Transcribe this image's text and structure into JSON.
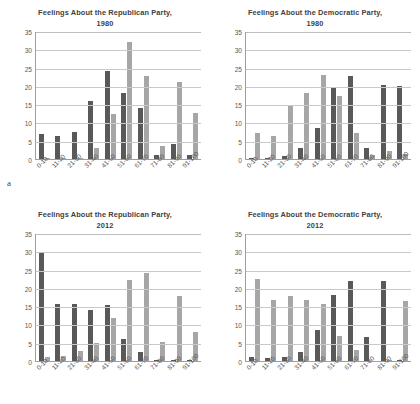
{
  "figure": {
    "panel_a_label": "a",
    "panel_b_label": "b",
    "series_colors": {
      "series1": "#595959",
      "series2": "#a6a6a6"
    }
  },
  "chart_data": [
    {
      "id": "rep1980",
      "type": "bar",
      "title": "Feelings About the Republican Party,",
      "subtitle": "1980",
      "xlabel": "",
      "ylabel": "",
      "ylim": [
        0,
        35
      ],
      "yticks": [
        0,
        5,
        10,
        15,
        20,
        25,
        30,
        35
      ],
      "grid": true,
      "legend": "none",
      "categories": [
        "0-10",
        "11-20",
        "21-30",
        "31-40",
        "41-50",
        "51-60",
        "61-70",
        "71-80",
        "81-90",
        "91-100"
      ],
      "series": [
        {
          "name": "series1",
          "values": [
            6.9,
            6.3,
            7.3,
            16.0,
            24.2,
            18.0,
            14.0,
            1.0,
            4.1,
            1.0
          ]
        },
        {
          "name": "series2",
          "values": [
            0.3,
            0.3,
            0.2,
            2.9,
            12.4,
            32.1,
            22.7,
            3.5,
            21.0,
            12.6
          ]
        }
      ]
    },
    {
      "id": "dem1980",
      "type": "bar",
      "title": "Feelings About the Democratic Party,",
      "subtitle": "1980",
      "xlabel": "",
      "ylabel": "",
      "ylim": [
        0,
        35
      ],
      "yticks": [
        0,
        5,
        10,
        15,
        20,
        25,
        30,
        35
      ],
      "grid": true,
      "legend": "none",
      "categories": [
        "0-10",
        "11-20",
        "21-30",
        "31-40",
        "41-50",
        "51-60",
        "61-70",
        "71-80",
        "81-90",
        "91-100"
      ],
      "series": [
        {
          "name": "series1",
          "values": [
            0.3,
            0.4,
            0.7,
            2.9,
            8.6,
            19.6,
            22.7,
            3.0,
            20.2,
            19.9
          ]
        },
        {
          "name": "series2",
          "values": [
            7.0,
            6.4,
            14.5,
            18.0,
            23.1,
            17.3,
            7.2,
            1.2,
            2.1,
            1.4
          ]
        }
      ]
    },
    {
      "id": "rep2012",
      "type": "bar",
      "title": "Feelings About the Republican Party,",
      "subtitle": "2012",
      "xlabel": "",
      "ylabel": "",
      "ylim": [
        0,
        35
      ],
      "yticks": [
        0,
        5,
        10,
        15,
        20,
        25,
        30,
        35
      ],
      "grid": true,
      "legend": "none",
      "categories": [
        "0-10",
        "11-20",
        "21-30",
        "31-40",
        "41-50",
        "51-60",
        "61-70",
        "71-80",
        "81-90",
        "91-100"
      ],
      "series": [
        {
          "name": "series1",
          "values": [
            29.9,
            15.5,
            15.5,
            13.9,
            15.3,
            5.9,
            2.4,
            0.4,
            0.4,
            0.2
          ]
        },
        {
          "name": "series2",
          "values": [
            1.0,
            1.5,
            2.8,
            5.0,
            11.7,
            22.2,
            24.1,
            5.1,
            17.7,
            7.8
          ]
        }
      ]
    },
    {
      "id": "dem2012",
      "type": "bar",
      "title": "Feelings About the Democratic Party,",
      "subtitle": "2012",
      "xlabel": "",
      "ylabel": "",
      "ylim": [
        0,
        35
      ],
      "yticks": [
        0,
        5,
        10,
        15,
        20,
        25,
        30,
        35
      ],
      "grid": true,
      "legend": "none",
      "categories": [
        "0-10",
        "11-20",
        "21-30",
        "31-40",
        "41-50",
        "51-60",
        "61-70",
        "71-80",
        "81-90",
        "91-100"
      ],
      "series": [
        {
          "name": "series1",
          "values": [
            1.0,
            0.7,
            1.2,
            2.6,
            8.4,
            18.0,
            22.0,
            6.6,
            22.0,
            0.2
          ]
        },
        {
          "name": "series2",
          "values": [
            22.3,
            16.6,
            17.9,
            16.6,
            15.6,
            6.8,
            2.9,
            0.1,
            0.2,
            16.3
          ]
        }
      ]
    }
  ]
}
